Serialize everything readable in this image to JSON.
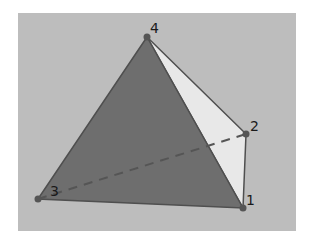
{
  "diagram": {
    "type": "tetrahedron",
    "background_color": "#bdbdbd",
    "colors": {
      "front_face": "#6e6e6e",
      "side_face": "#e8e8e8",
      "edge": "#4f4f4f",
      "vertex": "#555555",
      "hidden_edge": "#555555"
    },
    "vertices": [
      {
        "id": "1",
        "label": "1",
        "x": 243,
        "y": 208
      },
      {
        "id": "2",
        "label": "2",
        "x": 246,
        "y": 134
      },
      {
        "id": "3",
        "label": "3",
        "x": 38,
        "y": 199
      },
      {
        "id": "4",
        "label": "4",
        "x": 147,
        "y": 37
      }
    ],
    "faces": [
      {
        "name": "face-3-4-1",
        "vertices": [
          "3",
          "4",
          "1"
        ],
        "shade": "dark"
      },
      {
        "name": "face-4-2-1",
        "vertices": [
          "4",
          "2",
          "1"
        ],
        "shade": "light"
      }
    ],
    "hidden_edges": [
      {
        "from": "3",
        "to": "2",
        "style": "dashed"
      }
    ]
  }
}
